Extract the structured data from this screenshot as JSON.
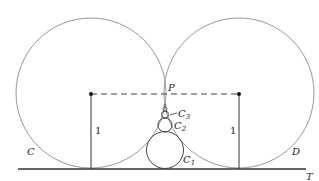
{
  "diagram": {
    "labels": {
      "circle_left": "C",
      "circle_right": "D",
      "point": "P",
      "line": "T",
      "c1": {
        "base": "C",
        "sub": "1"
      },
      "c2": {
        "base": "C",
        "sub": "2"
      },
      "c3": {
        "base": "C",
        "sub": "3"
      },
      "radius_left": "1",
      "radius_right": "1"
    },
    "colors": {
      "circle": "#999999",
      "line": "#333333"
    }
  }
}
